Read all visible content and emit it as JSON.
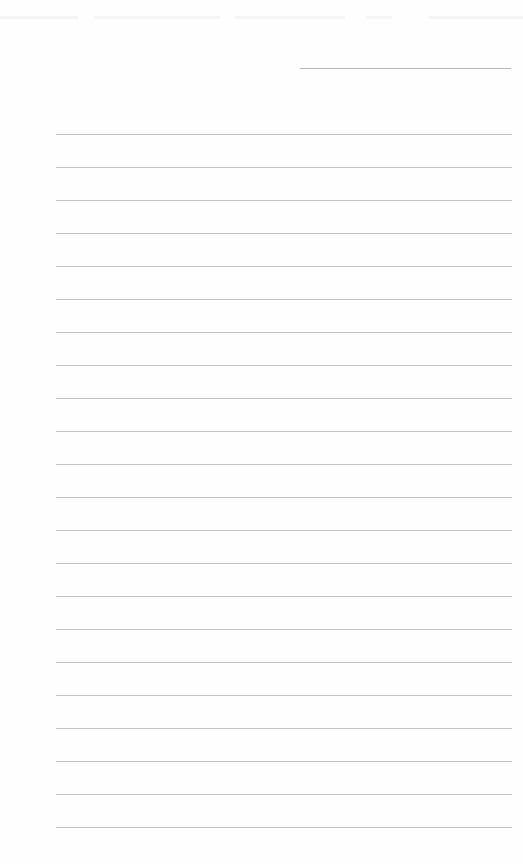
{
  "page": {
    "type": "blank-ruled-paper",
    "background_color": "#fefefe",
    "line_color": "#c4c4c4"
  },
  "header": {
    "signature_line": {
      "label": ""
    }
  },
  "ruled_lines": {
    "count": 22,
    "first_line_y": 134,
    "spacing_px": 33,
    "lines": [
      "",
      "",
      "",
      "",
      "",
      "",
      "",
      "",
      "",
      "",
      "",
      "",
      "",
      "",
      "",
      "",
      "",
      "",
      "",
      "",
      "",
      ""
    ]
  }
}
